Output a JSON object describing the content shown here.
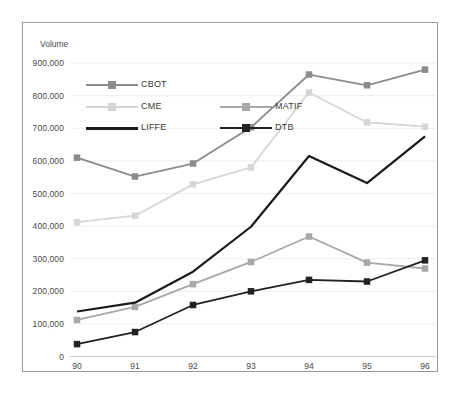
{
  "chart_data": {
    "type": "line",
    "title": "",
    "xlabel": "",
    "ylabel": "Volume",
    "x": [
      "90",
      "91",
      "92",
      "93",
      "94",
      "95",
      "96"
    ],
    "categories": [
      "90",
      "91",
      "92",
      "93",
      "94",
      "95",
      "96"
    ],
    "ylim": [
      0,
      900000
    ],
    "ytick_labels": [
      "900,000",
      "800,000",
      "700,000",
      "600,000",
      "500,000",
      "400,000",
      "300,000",
      "200,000",
      "100,000",
      "0"
    ],
    "ytick_values": [
      900000,
      800000,
      700000,
      600000,
      500000,
      400000,
      300000,
      200000,
      100000,
      0
    ],
    "grid": true,
    "grid_axis": "y",
    "legend_position": "inside-top-left",
    "series": [
      {
        "name": "CBOT",
        "color": "#8c8c8c",
        "marker": "square",
        "values": [
          610000,
          552000,
          592000,
          703000,
          865000,
          832000,
          880000
        ]
      },
      {
        "name": "CME",
        "color": "#d6d6d6",
        "marker": "square",
        "values": [
          412000,
          432000,
          528000,
          580000,
          810000,
          718000,
          705000
        ]
      },
      {
        "name": "MATIF",
        "color": "#a8a8a8",
        "marker": "square",
        "values": [
          112000,
          152000,
          222000,
          290000,
          368000,
          288000,
          270000
        ]
      },
      {
        "name": "LIFFE",
        "color": "#1a1a1a",
        "marker": "none",
        "values": [
          138000,
          165000,
          260000,
          398000,
          615000,
          532000,
          675000
        ]
      },
      {
        "name": "DTB",
        "color": "#222222",
        "marker": "square",
        "values": [
          38000,
          75000,
          158000,
          200000,
          235000,
          230000,
          295000
        ]
      }
    ]
  },
  "legend": {
    "entries": [
      {
        "label": "CBOT"
      },
      {
        "label": "CME"
      },
      {
        "label": "MATIF"
      },
      {
        "label": "LIFFE"
      },
      {
        "label": "DTB"
      }
    ]
  }
}
